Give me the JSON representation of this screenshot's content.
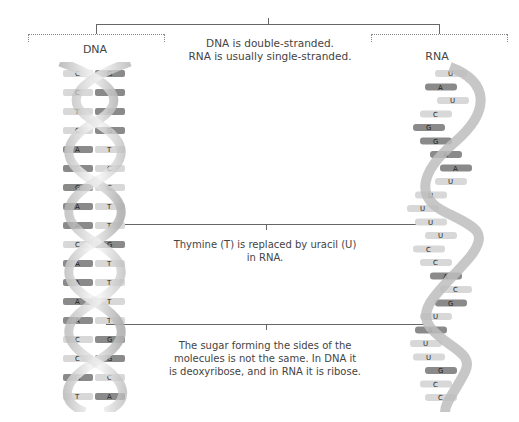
{
  "titles": {
    "dna": "DNA",
    "rna": "RNA"
  },
  "captions": {
    "strand": {
      "line1": "DNA is double-stranded.",
      "line2": "RNA is usually single-stranded."
    },
    "base": {
      "line1": "Thymine (T) is replaced by uracil (U)",
      "line2": "in RNA."
    },
    "sugar": {
      "line1": "The sugar forming the sides of the",
      "line2": "molecules is not the same. In DNA it",
      "line3": "is deoxyribose, and in RNA it is ribose."
    }
  },
  "dna_pairs": [
    [
      "C",
      "G"
    ],
    [
      "C",
      "G"
    ],
    [
      "T",
      "A"
    ],
    [
      "C",
      "G"
    ],
    [
      "A",
      "T"
    ],
    [
      "G",
      "C"
    ],
    [
      "G",
      "C"
    ],
    [
      "A",
      "T"
    ],
    [
      "A",
      "T"
    ],
    [
      "C",
      "G"
    ],
    [
      "A",
      "T"
    ],
    [
      "A",
      "T"
    ],
    [
      "A",
      "T"
    ],
    [
      "A",
      "T"
    ],
    [
      "C",
      "G"
    ],
    [
      "C",
      "G"
    ],
    [
      "G",
      "C"
    ],
    [
      "T",
      "A"
    ]
  ],
  "rna_bases": [
    "U",
    "A",
    "U",
    "C",
    "G",
    "G",
    "A",
    "A",
    "U",
    "U",
    "U",
    "U",
    "U",
    "C",
    "C",
    "A",
    "C",
    "G",
    "U",
    "A",
    "U",
    "U",
    "G",
    "C",
    "C"
  ],
  "colors": {
    "line": "#666666",
    "dotted": "#888888",
    "backbone": "#c8c8c8",
    "base_dark": "#8a8a8a",
    "base_light": "#d8d8d8",
    "text": "#444444"
  }
}
